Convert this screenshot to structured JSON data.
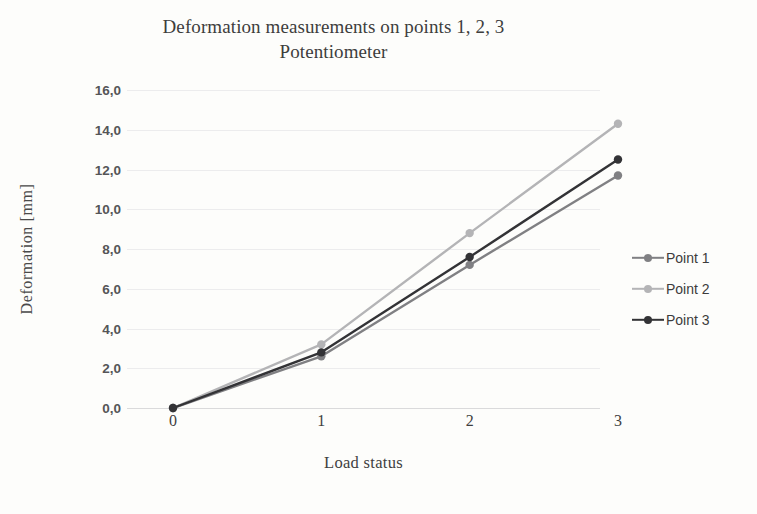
{
  "chart_data": {
    "type": "line",
    "title": "Deformation measurements on points 1, 2, 3",
    "subtitle": "Potentiometer",
    "xlabel": "Load status",
    "ylabel": "Deformation [mm]",
    "categories": [
      "0",
      "1",
      "2",
      "3"
    ],
    "x": [
      0,
      1,
      2,
      3
    ],
    "ylim": [
      0,
      16
    ],
    "yticks": [
      0,
      2,
      4,
      6,
      8,
      10,
      12,
      14,
      16
    ],
    "ytick_labels": [
      "0,0",
      "2,0",
      "4,0",
      "6,0",
      "8,0",
      "10,0",
      "12,0",
      "14,0",
      "16,0"
    ],
    "decimal_separator": ",",
    "grid": "horizontal",
    "legend_position": "right",
    "series": [
      {
        "name": "Point 1",
        "color": "#808083",
        "values": [
          0.0,
          2.6,
          7.2,
          11.7
        ]
      },
      {
        "name": "Point 2",
        "color": "#b4b4b6",
        "values": [
          0.0,
          3.2,
          8.8,
          14.3
        ]
      },
      {
        "name": "Point 3",
        "color": "#333336",
        "values": [
          0.0,
          2.8,
          7.6,
          12.5
        ]
      }
    ]
  },
  "title": {
    "line1": "Deformation measurements on points 1, 2, 3",
    "line2": "Potentiometer"
  },
  "axes": {
    "y_title": "Deformation [mm]",
    "x_title": "Load status"
  },
  "legend": {
    "items": [
      {
        "label": "Point 1"
      },
      {
        "label": "Point 2"
      },
      {
        "label": "Point 3"
      }
    ]
  }
}
